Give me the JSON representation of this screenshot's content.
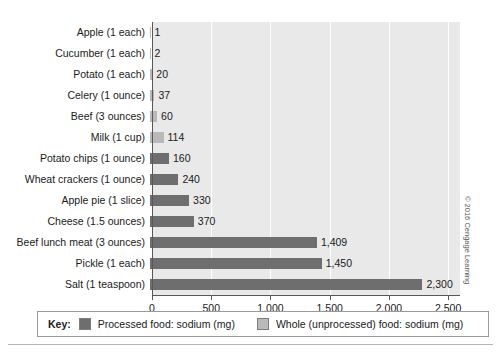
{
  "credit": "© 2016 Cengage Learning",
  "legend": {
    "key_word": "Key:",
    "entries": [
      {
        "label": "Processed food: sodium (mg)",
        "series": "processed",
        "color": "#6e6e6e"
      },
      {
        "label": "Whole (unprocessed) food: sodium (mg)",
        "series": "whole",
        "color": "#b9b9b9"
      }
    ]
  },
  "chart_data": {
    "type": "bar",
    "orientation": "horizontal",
    "title": "",
    "xlabel": "",
    "ylabel": "",
    "xlim": [
      0,
      2600
    ],
    "grid": true,
    "legend_position": "bottom",
    "tick_labels": [
      "0",
      "500",
      "1,000",
      "1,500",
      "2,000",
      "2,500"
    ],
    "ticks": [
      0,
      500,
      1000,
      1500,
      2000,
      2500
    ],
    "categories": [
      "Apple (1 each)",
      "Cucumber (1 each)",
      "Potato (1 each)",
      "Celery (1 ounce)",
      "Beef (3 ounces)",
      "Milk (1 cup)",
      "Potato chips (1 ounce)",
      "Wheat crackers (1 ounce)",
      "Apple pie (1 slice)",
      "Cheese (1.5 ounces)",
      "Beef lunch meat (3 ounces)",
      "Pickle (1 each)",
      "Salt (1 teaspoon)"
    ],
    "values": [
      1,
      2,
      20,
      37,
      60,
      114,
      160,
      240,
      330,
      370,
      1409,
      1450,
      2300
    ],
    "value_labels": [
      "1",
      "2",
      "20",
      "37",
      "60",
      "114",
      "160",
      "240",
      "330",
      "370",
      "1,409",
      "1,450",
      "2,300"
    ],
    "groups": [
      "whole",
      "whole",
      "whole",
      "whole",
      "whole",
      "whole",
      "processed",
      "processed",
      "processed",
      "processed",
      "processed",
      "processed",
      "processed"
    ],
    "colors": {
      "processed": "#6e6e6e",
      "whole": "#b9b9b9"
    }
  }
}
